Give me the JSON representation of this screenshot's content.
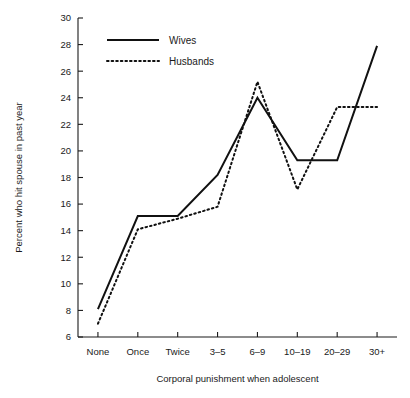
{
  "chart_data": {
    "type": "line",
    "title": "",
    "xlabel": "Corporal punishment when adolescent",
    "ylabel": "Percent who hit spouse in past year",
    "categories": [
      "None",
      "Once",
      "Twice",
      "3–5",
      "6–9",
      "10–19",
      "20–29",
      "30+"
    ],
    "ylim": [
      6,
      30
    ],
    "yticks": [
      6,
      8,
      10,
      12,
      14,
      16,
      18,
      20,
      22,
      24,
      26,
      28,
      30
    ],
    "ytick_labels": [
      "6",
      "8",
      "10",
      "12",
      "14",
      "16",
      "18",
      "20",
      "22",
      "24",
      "26",
      "28",
      "30"
    ],
    "grid": false,
    "legend_position": "upper-left-inside",
    "series": [
      {
        "name": "Wives",
        "style": "solid",
        "values": [
          8.1,
          15.1,
          15.1,
          18.2,
          24.0,
          19.3,
          19.3,
          27.9
        ]
      },
      {
        "name": "Husbands",
        "style": "dotted",
        "values": [
          7.0,
          14.1,
          14.9,
          15.8,
          25.2,
          17.1,
          23.3,
          23.3
        ]
      }
    ]
  },
  "legend": {
    "entries": [
      {
        "label": "Wives",
        "style": "solid"
      },
      {
        "label": "Husbands",
        "style": "dotted"
      }
    ]
  }
}
